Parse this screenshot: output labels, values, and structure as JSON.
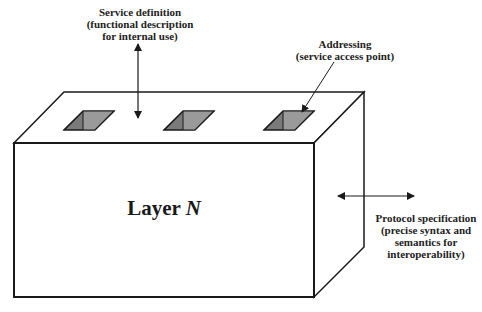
{
  "diagram": {
    "layer": {
      "label": "Layer",
      "variable": "N"
    },
    "service_definition": {
      "lines": [
        "Service definition",
        "(functional description",
        "for internal use)"
      ]
    },
    "addressing": {
      "lines": [
        "Addressing",
        "(service access point)"
      ]
    },
    "protocol_specification": {
      "lines": [
        "Protocol specification",
        "(precise syntax and",
        "semantics for",
        "interoperability)"
      ]
    },
    "colors": {
      "stroke": "#1a1a1a",
      "hole_fill": "#7a7a7a",
      "hole_inner": "#9a9a9a",
      "background": "#ffffff"
    },
    "access_points": 3
  }
}
